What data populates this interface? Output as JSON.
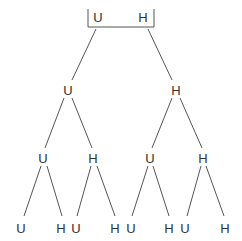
{
  "diagram": {
    "type": "probability-tree",
    "root": {
      "labels": [
        "U",
        "H"
      ]
    },
    "levels": [
      {
        "nodes": [
          {
            "label": "U",
            "x": 68,
            "y": 90
          },
          {
            "label": "H",
            "x": 176,
            "y": 90
          }
        ]
      },
      {
        "nodes": [
          {
            "label": "U",
            "x": 43,
            "y": 158
          },
          {
            "label": "H",
            "x": 93,
            "y": 158
          },
          {
            "label": "U",
            "x": 150,
            "y": 158
          },
          {
            "label": "H",
            "x": 203,
            "y": 158
          }
        ]
      },
      {
        "nodes": [
          {
            "label": "U",
            "x": 21,
            "y": 228
          },
          {
            "label": "H",
            "x": 61,
            "y": 228
          },
          {
            "label": "U",
            "x": 76,
            "y": 228
          },
          {
            "label": "H",
            "x": 115,
            "y": 228
          },
          {
            "label": "U",
            "x": 131,
            "y": 228
          },
          {
            "label": "H",
            "x": 169,
            "y": 228
          },
          {
            "label": "U",
            "x": 185,
            "y": 228
          },
          {
            "label": "H",
            "x": 225,
            "y": 228
          }
        ]
      }
    ],
    "colors": {
      "line": "#555555",
      "text": "#333333",
      "background": "#ffffff"
    }
  }
}
